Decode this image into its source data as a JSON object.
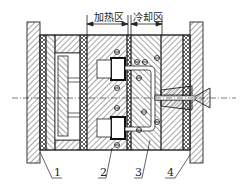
{
  "diagram": {
    "type": "mold-cross-section",
    "zones": [
      {
        "label": "加热区",
        "x_from": 87,
        "x_to": 128
      },
      {
        "label": "冷却区",
        "x_from": 131,
        "x_to": 162
      }
    ],
    "callouts": [
      {
        "label": "1",
        "x": 55
      },
      {
        "label": "2",
        "x": 101
      },
      {
        "label": "3",
        "x": 136
      },
      {
        "label": "4",
        "x": 168
      }
    ],
    "colors": {
      "line": "#1a1a1a",
      "background": "#ffffff"
    }
  }
}
